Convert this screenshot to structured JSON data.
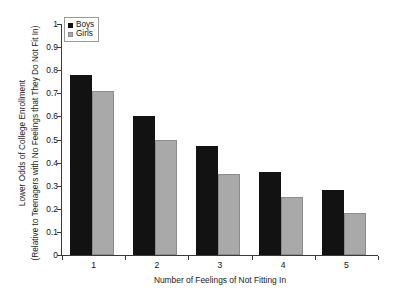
{
  "chart_data": {
    "type": "bar",
    "title": "",
    "subtitle": "",
    "categories": [
      "1",
      "2",
      "3",
      "4",
      "5"
    ],
    "series": [
      {
        "name": "Boys",
        "color": "#121212",
        "values": [
          0.78,
          0.6,
          0.47,
          0.36,
          0.28
        ]
      },
      {
        "name": "Girls",
        "color": "#a9a9a9",
        "values": [
          0.71,
          0.5,
          0.35,
          0.25,
          0.18
        ]
      }
    ],
    "xlabel": "Number of Feelings of Not Fitting In",
    "ylabel_line1": "Lower Odds of College Enrollment",
    "ylabel_line2": "(Relative to Teenagers with No Feelings that They Do Not Fit In)",
    "ylim": [
      0,
      1
    ],
    "yticks": [
      "0",
      "0.1",
      "0.2",
      "0.3",
      "0.4",
      "0.5",
      "0.6",
      "0.7",
      "0.8",
      "0.9",
      "1"
    ],
    "ytick_values": [
      0,
      0.1,
      0.2,
      0.3,
      0.4,
      0.5,
      0.6,
      0.7,
      0.8,
      0.9,
      1
    ],
    "grid": false,
    "legend_position": "top-left-inside"
  },
  "legend": {
    "items": [
      {
        "label": "Boys",
        "swatch": "black-square-swatch"
      },
      {
        "label": "Girls",
        "swatch": "gray-square-swatch"
      }
    ]
  },
  "caption": {
    "text": ""
  }
}
